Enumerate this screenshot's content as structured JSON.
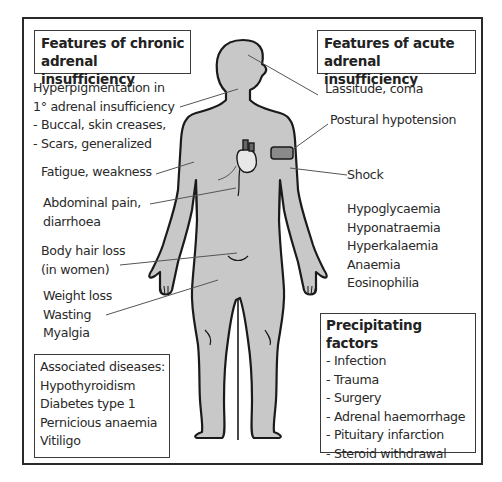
{
  "diagram": {
    "chronic_box": {
      "title_lines": [
        "Features of chronic",
        "adrenal insufficiency"
      ]
    },
    "acute_box": {
      "title_lines": [
        "Features of acute",
        "adrenal insufficiency"
      ]
    },
    "chronic_features": {
      "hyperpigmentation": [
        "Hyperpigmentation in",
        "1° adrenal insufficiency",
        "- Buccal, skin creases,",
        "- Scars, generalized"
      ],
      "fatigue": "Fatigue, weakness",
      "abdominal": [
        "Abdominal pain,",
        "diarrhoea"
      ],
      "hair_loss": [
        "Body hair loss",
        "(in women)"
      ],
      "weight": [
        "Weight loss",
        "Wasting",
        "Myalgia"
      ]
    },
    "acute_features": {
      "lassitude": "Lassitude, coma",
      "postural": "Postural hypotension",
      "shock": "Shock",
      "lab_findings": [
        "Hypoglycaemia",
        "Hyponatraemia",
        "Hyperkalaemia",
        "Anaemia",
        "Eosinophilia"
      ]
    },
    "associated_diseases": {
      "title": "Associated diseases:",
      "items": [
        "Hypothyroidism",
        "Diabetes type 1",
        "Pernicious anaemia",
        "Vitiligo"
      ]
    },
    "precipitating_factors": {
      "title": "Precipitating factors",
      "items": [
        "- Infection",
        "- Trauma",
        "- Surgery",
        "- Adrenal haemorrhage",
        "- Pituitary infarction",
        "- Steroid withdrawal"
      ]
    },
    "colors": {
      "body_fill": "#c8c8c8",
      "outline": "#1a1a1a",
      "leader_line": "#555555",
      "cuff_fill": "#8a8a8a"
    }
  }
}
